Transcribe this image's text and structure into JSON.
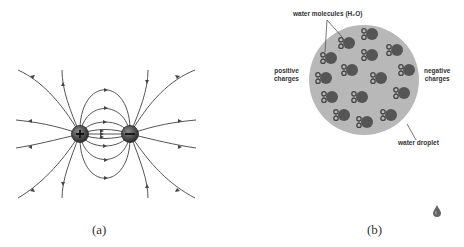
{
  "panels": {
    "a": {
      "caption": "(a)",
      "positive_symbol": "+",
      "negative_symbol": "−",
      "description": "Electric field lines between a positive and a negative charge"
    },
    "b": {
      "caption": "(b)",
      "labels": {
        "molecules": "water molecules (H₂O)",
        "positive": [
          "positive",
          "charges"
        ],
        "negative": [
          "negative",
          "charges"
        ],
        "droplet": "water droplet"
      }
    }
  },
  "colors": {
    "line": "#555555",
    "charge": "#3a3a3a",
    "droplet": "#b8b8b8",
    "molecule": "#555555",
    "label": "#333333"
  },
  "icons": {
    "corner_drop": "water-drop-icon"
  }
}
